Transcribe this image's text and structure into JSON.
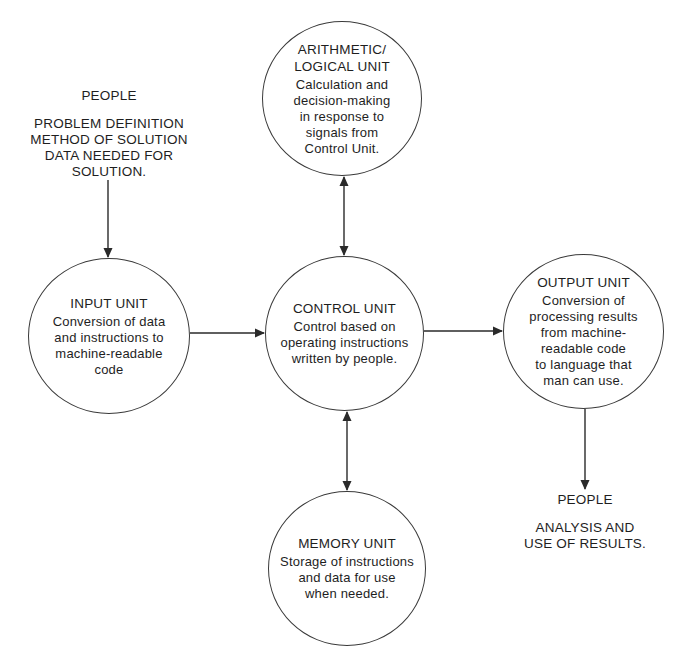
{
  "diagram": {
    "type": "block-diagram",
    "nodes": {
      "alu": {
        "title": "ARITHMETIC/\nLOGICAL UNIT",
        "description": "Calculation and\ndecision-making\nin response to\nsignals from\nControl Unit."
      },
      "input": {
        "title": "INPUT UNIT",
        "description": "Conversion of data\nand instructions to\nmachine-readable\ncode"
      },
      "control": {
        "title": "CONTROL UNIT",
        "description": "Control based on\noperating instructions\nwritten by people."
      },
      "output": {
        "title": "OUTPUT UNIT",
        "description": "Conversion of\nprocessing results\nfrom machine-\nreadable code\nto language that\nman can use."
      },
      "memory": {
        "title": "MEMORY UNIT",
        "description": "Storage of instructions\nand data for use\nwhen needed."
      }
    },
    "labels": {
      "people_in": {
        "title": "PEOPLE",
        "body": "PROBLEM DEFINITION\nMETHOD OF SOLUTION\nDATA NEEDED FOR\nSOLUTION."
      },
      "people_out": {
        "title": "PEOPLE",
        "body": "ANALYSIS AND\nUSE OF RESULTS."
      }
    },
    "edges": [
      {
        "from": "people_in",
        "to": "input",
        "direction": "forward"
      },
      {
        "from": "input",
        "to": "control",
        "direction": "forward"
      },
      {
        "from": "control",
        "to": "output",
        "direction": "forward"
      },
      {
        "from": "output",
        "to": "people_out",
        "direction": "forward"
      },
      {
        "from": "alu",
        "to": "control",
        "direction": "bidirectional"
      },
      {
        "from": "control",
        "to": "memory",
        "direction": "bidirectional"
      }
    ],
    "colors": {
      "stroke": "#2a2a2a",
      "text": "#1e1e1e",
      "background": "#ffffff"
    }
  }
}
